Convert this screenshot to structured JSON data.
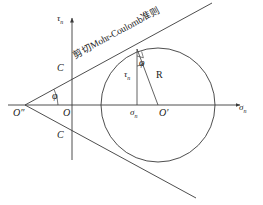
{
  "figure": {
    "type": "geometric-diagram",
    "background_color": "#ffffff",
    "stroke_color": "#3a3a3a",
    "text_color": "#1a1a1a"
  },
  "axes": {
    "vertical": {
      "label_main": "τ",
      "label_sub": "n",
      "full_label": "τn",
      "description": "shear stress axis"
    },
    "horizontal": {
      "label_main": "σ",
      "label_sub": "n",
      "full_label": "σn",
      "description": "normal stress axis"
    },
    "origin_label": "O"
  },
  "annotations": {
    "criterion_label": "剪切Mohr-Coulomb准则",
    "cohesion_upper": "C",
    "cohesion_lower": "C",
    "friction_angle_left": "φ",
    "friction_angle_circle": "φ",
    "radius_label": "R",
    "shear_stress_label": "τ",
    "shear_stress_sub": "n",
    "normal_stress_label": "σ",
    "normal_stress_sub": "n",
    "apex_label": "O″",
    "circle_center_label": "O′"
  },
  "geometry": {
    "circle_center_x": 158,
    "circle_center_y": 105,
    "circle_radius": 57,
    "apex_x": 25,
    "apex_y": 105,
    "origin_x": 72,
    "origin_y": 105,
    "tangent_point_x": 137,
    "tangent_point_y": 49,
    "friction_angle_degrees": 28.5
  }
}
